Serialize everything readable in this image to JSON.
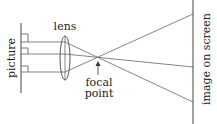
{
  "diagram": {
    "labels": {
      "lens": "lens",
      "picture": "picture",
      "focal_line1": "focal",
      "focal_line2": "point",
      "screen": "image on screen"
    },
    "colors": {
      "line": "#444444",
      "ray": "#666666",
      "text": "#222222",
      "background": "#ffffff"
    }
  }
}
